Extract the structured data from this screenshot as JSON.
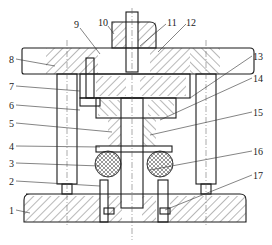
{
  "figure": {
    "type": "mechanical die assembly cross-section",
    "callouts": [
      {
        "id": "1",
        "x": 9,
        "y": 211,
        "tx": 30,
        "ty": 213
      },
      {
        "id": "2",
        "x": 9,
        "y": 182,
        "tx": 100,
        "ty": 186
      },
      {
        "id": "3",
        "x": 9,
        "y": 164,
        "tx": 100,
        "ty": 166
      },
      {
        "id": "4",
        "x": 9,
        "y": 147,
        "tx": 100,
        "ty": 147
      },
      {
        "id": "5",
        "x": 9,
        "y": 124,
        "tx": 112,
        "ty": 132
      },
      {
        "id": "6",
        "x": 9,
        "y": 106,
        "tx": 80,
        "ty": 110
      },
      {
        "id": "7",
        "x": 9,
        "y": 87,
        "tx": 80,
        "ty": 91
      },
      {
        "id": "8",
        "x": 9,
        "y": 60,
        "tx": 55,
        "ty": 66
      },
      {
        "id": "9",
        "x": 74,
        "y": 29,
        "tx": 100,
        "ty": 54
      },
      {
        "id": "10",
        "x": 100,
        "y": 27,
        "tx": 112,
        "ty": 34
      },
      {
        "id": "11",
        "x": 166,
        "y": 27,
        "tx": 140,
        "ty": 46
      },
      {
        "id": "12",
        "x": 186,
        "y": 27,
        "tx": 158,
        "ty": 52
      },
      {
        "id": "13",
        "x": 252,
        "y": 59,
        "tx": 190,
        "ty": 98
      },
      {
        "id": "14",
        "x": 252,
        "y": 81,
        "tx": 160,
        "ty": 120
      },
      {
        "id": "15",
        "x": 252,
        "y": 115,
        "tx": 150,
        "ty": 135
      },
      {
        "id": "16",
        "x": 252,
        "y": 154,
        "tx": 150,
        "ty": 170
      },
      {
        "id": "17",
        "x": 252,
        "y": 178,
        "tx": 165,
        "ty": 210
      }
    ]
  }
}
